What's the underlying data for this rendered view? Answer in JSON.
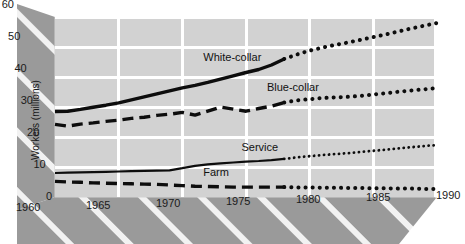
{
  "chart_data": {
    "type": "line",
    "title": "",
    "subtitle": "",
    "xlabel": "",
    "ylabel": "Workers (millions)",
    "xlim": [
      1960,
      1990
    ],
    "ylim": [
      0,
      60
    ],
    "grid": true,
    "legend_position": "inline-labels",
    "xticks": [
      "1960",
      "1965",
      "1970",
      "1975",
      "1980",
      "1985",
      "1990"
    ],
    "xtick_values": [
      1960,
      1965,
      1970,
      1975,
      1980,
      1985,
      1990
    ],
    "yticks": [
      "0",
      "10",
      "20",
      "30",
      "40",
      "50",
      "60"
    ],
    "ytick_values": [
      0,
      10,
      20,
      30,
      40,
      50,
      60
    ],
    "projection_start_year": 1978,
    "annotations": [
      {
        "text": "White-collar",
        "x": 1974,
        "y": 46.5
      },
      {
        "text": "Blue-collar",
        "x": 1979,
        "y": 36.5
      },
      {
        "text": "Service",
        "x": 1977,
        "y": 16.5
      },
      {
        "text": "Farm",
        "x": 1974,
        "y": 8.0
      }
    ],
    "x": [
      1960,
      1961,
      1962,
      1963,
      1964,
      1965,
      1966,
      1967,
      1968,
      1969,
      1970,
      1971,
      1972,
      1973,
      1974,
      1975,
      1976,
      1977,
      1978,
      1979,
      1980,
      1981,
      1982,
      1983,
      1984,
      1985,
      1986,
      1987,
      1988,
      1989,
      1990
    ],
    "series": [
      {
        "name": "White-collar",
        "style": "solid-thick",
        "projection_style": "dotted",
        "values": [
          28.5,
          28.6,
          29.2,
          29.9,
          30.6,
          31.4,
          32.4,
          33.4,
          34.4,
          35.4,
          36.4,
          37.2,
          38.2,
          39.3,
          40.4,
          41.5,
          42.5,
          44.0,
          46.0,
          47.5,
          48.8,
          49.8,
          50.7,
          51.5,
          52.4,
          53.3,
          54.2,
          55.2,
          56.2,
          57.1,
          58.0
        ]
      },
      {
        "name": "Blue-collar",
        "style": "dashed-thick",
        "projection_style": "dotted",
        "values": [
          24.2,
          23.6,
          24.3,
          24.7,
          25.2,
          25.6,
          26.2,
          26.6,
          27.2,
          27.6,
          28.2,
          27.3,
          28.6,
          30.0,
          29.3,
          28.6,
          29.5,
          30.3,
          31.5,
          32.2,
          32.6,
          33.0,
          33.2,
          33.4,
          33.7,
          34.2,
          34.6,
          35.1,
          35.5,
          35.9,
          36.3
        ]
      },
      {
        "name": "Service",
        "style": "solid-thin",
        "projection_style": "dotted",
        "values": [
          8.0,
          8.1,
          8.2,
          8.3,
          8.4,
          8.5,
          8.6,
          8.7,
          8.8,
          8.9,
          9.6,
          10.4,
          10.9,
          11.2,
          11.5,
          11.8,
          12.0,
          12.3,
          12.7,
          13.2,
          13.6,
          14.0,
          14.3,
          14.6,
          15.0,
          15.4,
          15.8,
          16.2,
          16.6,
          17.0,
          17.3
        ]
      },
      {
        "name": "Farm",
        "style": "dashed-thick",
        "projection_style": "dotted",
        "values": [
          5.2,
          5.0,
          4.9,
          4.7,
          4.6,
          4.5,
          4.4,
          4.3,
          4.2,
          4.0,
          3.8,
          3.6,
          3.5,
          3.4,
          3.3,
          3.3,
          3.3,
          3.3,
          3.3,
          3.2,
          3.2,
          3.1,
          3.1,
          3.0,
          3.0,
          2.9,
          2.9,
          2.8,
          2.8,
          2.7,
          2.7
        ]
      }
    ]
  },
  "colors": {
    "plot_background": "#d2d2d2",
    "panel_dark": "#9a9a9a",
    "panel_stripe": "#f2f2f2",
    "gridline": "#ffffff",
    "line": "#0d0d0d",
    "text": "#1a1a1a",
    "page_background": "#ffffff"
  }
}
